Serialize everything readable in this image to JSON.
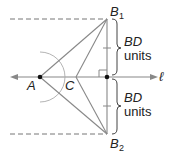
{
  "diagram": {
    "points": {
      "A": {
        "label": "A",
        "x": 40,
        "y": 77
      },
      "C": {
        "label": "C",
        "x": 76,
        "y": 77
      },
      "D": {
        "x": 107,
        "y": 77
      },
      "B1": {
        "label": "B",
        "subscript": "1",
        "x": 107,
        "y": 19
      },
      "B2": {
        "label": "B",
        "subscript": "2",
        "x": 107,
        "y": 134
      }
    },
    "line_label": "ℓ",
    "upper_brace": {
      "line1": "BD",
      "line2": "units"
    },
    "lower_brace": {
      "line1": "BD",
      "line2": "units"
    },
    "colors": {
      "line": "#888888",
      "dashed": "#777777",
      "text": "#222222",
      "point": "#111111"
    }
  }
}
